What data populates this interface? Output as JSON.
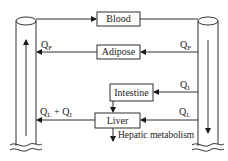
{
  "diagram": {
    "type": "pbpk-compartment-flow",
    "compartments": [
      {
        "id": "blood",
        "label": "Blood"
      },
      {
        "id": "adipose",
        "label": "Adipose"
      },
      {
        "id": "intestine",
        "label": "Intestine"
      },
      {
        "id": "liver",
        "label": "Liver"
      }
    ],
    "vessels": [
      {
        "id": "left-vessel",
        "direction": "up"
      },
      {
        "id": "right-vessel",
        "direction": "down"
      }
    ],
    "flows": {
      "adipose_left": {
        "symbol": "Q",
        "sub": "F"
      },
      "adipose_right": {
        "symbol": "Q",
        "sub": "F"
      },
      "intestine_right": {
        "symbol": "Q",
        "sub": "I"
      },
      "liver_right": {
        "symbol": "Q",
        "sub": "L"
      },
      "liver_left_a": {
        "symbol": "Q",
        "sub": "L"
      },
      "liver_left_plus": "+",
      "liver_left_b": {
        "symbol": "Q",
        "sub": "I"
      }
    },
    "hepatic_note": "Hepatic metabolism",
    "colors": {
      "line": "#1a1a1a",
      "background": "#ffffff"
    }
  }
}
